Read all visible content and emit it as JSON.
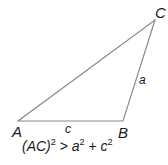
{
  "diagram": {
    "type": "obtuse-triangle",
    "vertices": [
      {
        "label": "A",
        "x": 18,
        "y": 121
      },
      {
        "label": "B",
        "x": 123,
        "y": 121
      },
      {
        "label": "C",
        "x": 155,
        "y": 20
      }
    ],
    "sides": [
      {
        "label": "c",
        "between": "A-B"
      },
      {
        "label": "a",
        "between": "B-C"
      }
    ],
    "line_color": "#8a8a8a",
    "text_color": "#1a1a1a"
  },
  "labels": {
    "A": "A",
    "B": "B",
    "C": "C",
    "a": "a",
    "c": "c"
  },
  "equation": {
    "lhs": "(AC)",
    "lhs_exp": "2",
    "op": ">",
    "t1": "a",
    "t1_exp": "2",
    "plus": "+",
    "t2": "c",
    "t2_exp": "2"
  }
}
